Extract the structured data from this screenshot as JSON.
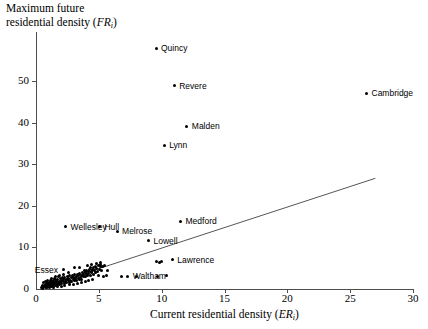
{
  "chart_data": {
    "type": "scatter",
    "title": "",
    "xlabel": "Current residential density (ERi)",
    "ylabel": "Maximum future residential density (FRi)",
    "xlabel_main": "Current residential density (",
    "xlabel_italic": "ER",
    "xlabel_sub": "i",
    "xlabel_close": ")",
    "ylabel_line1": "Maximum future",
    "ylabel_line2_main": "residential density (",
    "ylabel_italic": "FR",
    "ylabel_sub": "i",
    "ylabel_close": ")",
    "xlim": [
      0,
      30
    ],
    "ylim": [
      0,
      60
    ],
    "xticks": [
      0,
      5,
      10,
      15,
      20,
      25,
      30
    ],
    "yticks": [
      0,
      10,
      20,
      30,
      40,
      50
    ],
    "grid": false,
    "legend": "none",
    "trendline": {
      "x0": 0.45,
      "y0": 0.4,
      "x1": 27.0,
      "y1": 26.6
    },
    "labeled_points": [
      {
        "label": "Quincy",
        "x": 9.55,
        "y": 57.8,
        "side": "right"
      },
      {
        "label": "Revere",
        "x": 11.0,
        "y": 48.8,
        "side": "right"
      },
      {
        "label": "Malden",
        "x": 12.0,
        "y": 39.1,
        "side": "right"
      },
      {
        "label": "Lynn",
        "x": 10.2,
        "y": 34.6,
        "side": "right"
      },
      {
        "label": "Cambridge",
        "x": 26.3,
        "y": 47.0,
        "side": "right"
      },
      {
        "label": "Medford",
        "x": 11.5,
        "y": 16.3,
        "side": "right"
      },
      {
        "label": "Wellesley",
        "x": 2.35,
        "y": 14.9,
        "side": "right"
      },
      {
        "label": "Hull",
        "x": 5.05,
        "y": 14.9,
        "side": "right"
      },
      {
        "label": "Melrose",
        "x": 6.45,
        "y": 13.9,
        "side": "right"
      },
      {
        "label": "Lowell",
        "x": 8.95,
        "y": 11.6,
        "side": "right"
      },
      {
        "label": "Lawrence",
        "x": 10.85,
        "y": 7.0,
        "side": "right"
      },
      {
        "label": "Essex",
        "x": 2.15,
        "y": 4.6,
        "side": "left"
      },
      {
        "label": "Waltham",
        "x": 7.3,
        "y": 3.1,
        "side": "right"
      }
    ],
    "points": [
      [
        0.45,
        0.35
      ],
      [
        0.55,
        0.5
      ],
      [
        0.6,
        0.3
      ],
      [
        0.65,
        0.75
      ],
      [
        0.7,
        0.5
      ],
      [
        0.72,
        1.0
      ],
      [
        0.78,
        0.6
      ],
      [
        0.8,
        1.2
      ],
      [
        0.85,
        0.4
      ],
      [
        0.88,
        0.9
      ],
      [
        0.92,
        1.4
      ],
      [
        0.95,
        0.7
      ],
      [
        1.0,
        1.1
      ],
      [
        1.05,
        0.5
      ],
      [
        1.08,
        1.6
      ],
      [
        1.12,
        0.9
      ],
      [
        1.15,
        1.3
      ],
      [
        1.2,
        0.6
      ],
      [
        1.25,
        1.8
      ],
      [
        1.3,
        1.0
      ],
      [
        1.32,
        1.45
      ],
      [
        1.38,
        0.8
      ],
      [
        1.42,
        2.0
      ],
      [
        1.45,
        1.2
      ],
      [
        1.5,
        1.6
      ],
      [
        1.52,
        0.9
      ],
      [
        1.58,
        2.2
      ],
      [
        1.6,
        1.35
      ],
      [
        1.65,
        1.8
      ],
      [
        1.7,
        1.05
      ],
      [
        1.75,
        2.4
      ],
      [
        1.8,
        1.5
      ],
      [
        1.85,
        1.9
      ],
      [
        1.88,
        1.15
      ],
      [
        1.92,
        2.55
      ],
      [
        1.95,
        1.6
      ],
      [
        2.0,
        2.1
      ],
      [
        2.05,
        1.3
      ],
      [
        2.1,
        2.7
      ],
      [
        2.15,
        1.75
      ],
      [
        2.2,
        2.25
      ],
      [
        2.25,
        1.4
      ],
      [
        2.3,
        2.85
      ],
      [
        2.35,
        1.9
      ],
      [
        2.4,
        2.4
      ],
      [
        2.45,
        1.55
      ],
      [
        2.5,
        3.0
      ],
      [
        2.55,
        2.0
      ],
      [
        2.6,
        2.55
      ],
      [
        2.65,
        1.65
      ],
      [
        2.7,
        3.15
      ],
      [
        2.75,
        2.15
      ],
      [
        2.8,
        2.7
      ],
      [
        2.85,
        1.8
      ],
      [
        2.9,
        3.3
      ],
      [
        2.95,
        2.3
      ],
      [
        3.0,
        2.85
      ],
      [
        3.05,
        1.95
      ],
      [
        3.1,
        3.45
      ],
      [
        3.15,
        2.45
      ],
      [
        3.2,
        3.0
      ],
      [
        3.25,
        2.1
      ],
      [
        3.3,
        3.6
      ],
      [
        3.35,
        2.6
      ],
      [
        3.4,
        3.15
      ],
      [
        3.45,
        2.25
      ],
      [
        3.5,
        3.75
      ],
      [
        3.55,
        2.75
      ],
      [
        3.6,
        3.3
      ],
      [
        3.65,
        2.4
      ],
      [
        3.7,
        3.9
      ],
      [
        3.75,
        2.9
      ],
      [
        3.8,
        3.45
      ],
      [
        3.85,
        4.35
      ],
      [
        3.9,
        3.05
      ],
      [
        3.95,
        4.0
      ],
      [
        4.0,
        3.6
      ],
      [
        4.05,
        4.5
      ],
      [
        4.1,
        3.2
      ],
      [
        4.15,
        4.15
      ],
      [
        4.2,
        3.75
      ],
      [
        4.25,
        4.65
      ],
      [
        4.3,
        5.05
      ],
      [
        4.35,
        3.35
      ],
      [
        4.4,
        4.3
      ],
      [
        4.45,
        3.9
      ],
      [
        4.5,
        4.8
      ],
      [
        4.55,
        5.2
      ],
      [
        4.6,
        3.5
      ],
      [
        4.65,
        4.45
      ],
      [
        4.7,
        4.05
      ],
      [
        4.75,
        5.5
      ],
      [
        4.8,
        4.95
      ],
      [
        4.9,
        4.2
      ],
      [
        4.95,
        5.7
      ],
      [
        5.0,
        3.15
      ],
      [
        5.05,
        4.6
      ],
      [
        5.1,
        5.35
      ],
      [
        5.15,
        5.9
      ],
      [
        5.2,
        4.35
      ],
      [
        5.3,
        5.5
      ],
      [
        5.35,
        3.0
      ],
      [
        5.45,
        5.7
      ],
      [
        5.6,
        3.2
      ],
      [
        5.7,
        4.5
      ],
      [
        3.45,
        5.2
      ],
      [
        3.1,
        5.15
      ],
      [
        2.6,
        4.0
      ],
      [
        2.2,
        3.55
      ],
      [
        1.9,
        3.2
      ],
      [
        1.55,
        2.9
      ],
      [
        1.25,
        2.45
      ],
      [
        0.95,
        2.0
      ],
      [
        0.75,
        1.7
      ],
      [
        0.6,
        1.45
      ],
      [
        4.1,
        5.6
      ],
      [
        4.45,
        5.85
      ],
      [
        4.8,
        6.1
      ],
      [
        5.15,
        6.3
      ],
      [
        9.6,
        6.55
      ],
      [
        9.85,
        6.3
      ],
      [
        9.95,
        6.6
      ],
      [
        10.4,
        3.2
      ],
      [
        9.7,
        3.1
      ],
      [
        8.0,
        3.0
      ],
      [
        6.8,
        2.95
      ],
      [
        0.5,
        0.2
      ],
      [
        0.85,
        0.25
      ],
      [
        1.1,
        0.35
      ],
      [
        1.4,
        0.45
      ],
      [
        1.7,
        0.55
      ],
      [
        2.0,
        0.7
      ],
      [
        2.3,
        0.85
      ],
      [
        2.65,
        1.0
      ],
      [
        3.0,
        1.2
      ],
      [
        3.3,
        1.35
      ],
      [
        3.6,
        1.55
      ],
      [
        3.9,
        1.75
      ],
      [
        4.2,
        1.95
      ],
      [
        4.5,
        2.2
      ],
      [
        0.55,
        0.95
      ],
      [
        0.9,
        1.5
      ],
      [
        1.15,
        2.1
      ],
      [
        1.45,
        2.55
      ],
      [
        1.8,
        2.95
      ]
    ]
  }
}
